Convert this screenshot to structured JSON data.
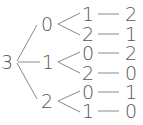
{
  "diagram": {
    "type": "tree",
    "root": {
      "label": "3",
      "x": 7,
      "y": 62
    },
    "branches": [
      {
        "label": "0",
        "x": 47,
        "y": 24,
        "children": [
          {
            "label": "1",
            "x": 88,
            "y": 14,
            "leaf": {
              "label": "2",
              "x": 131,
              "y": 14
            }
          },
          {
            "label": "2",
            "x": 88,
            "y": 34,
            "leaf": {
              "label": "1",
              "x": 131,
              "y": 34
            }
          }
        ]
      },
      {
        "label": "1",
        "x": 48,
        "y": 62,
        "children": [
          {
            "label": "0",
            "x": 88,
            "y": 53,
            "leaf": {
              "label": "2",
              "x": 131,
              "y": 53
            }
          },
          {
            "label": "2",
            "x": 88,
            "y": 73,
            "leaf": {
              "label": "0",
              "x": 131,
              "y": 73
            }
          }
        ]
      },
      {
        "label": "2",
        "x": 47,
        "y": 101,
        "children": [
          {
            "label": "0",
            "x": 88,
            "y": 92,
            "leaf": {
              "label": "1",
              "x": 131,
              "y": 92
            }
          },
          {
            "label": "1",
            "x": 88,
            "y": 111,
            "leaf": {
              "label": "0",
              "x": 131,
              "y": 111
            }
          }
        ]
      }
    ]
  }
}
